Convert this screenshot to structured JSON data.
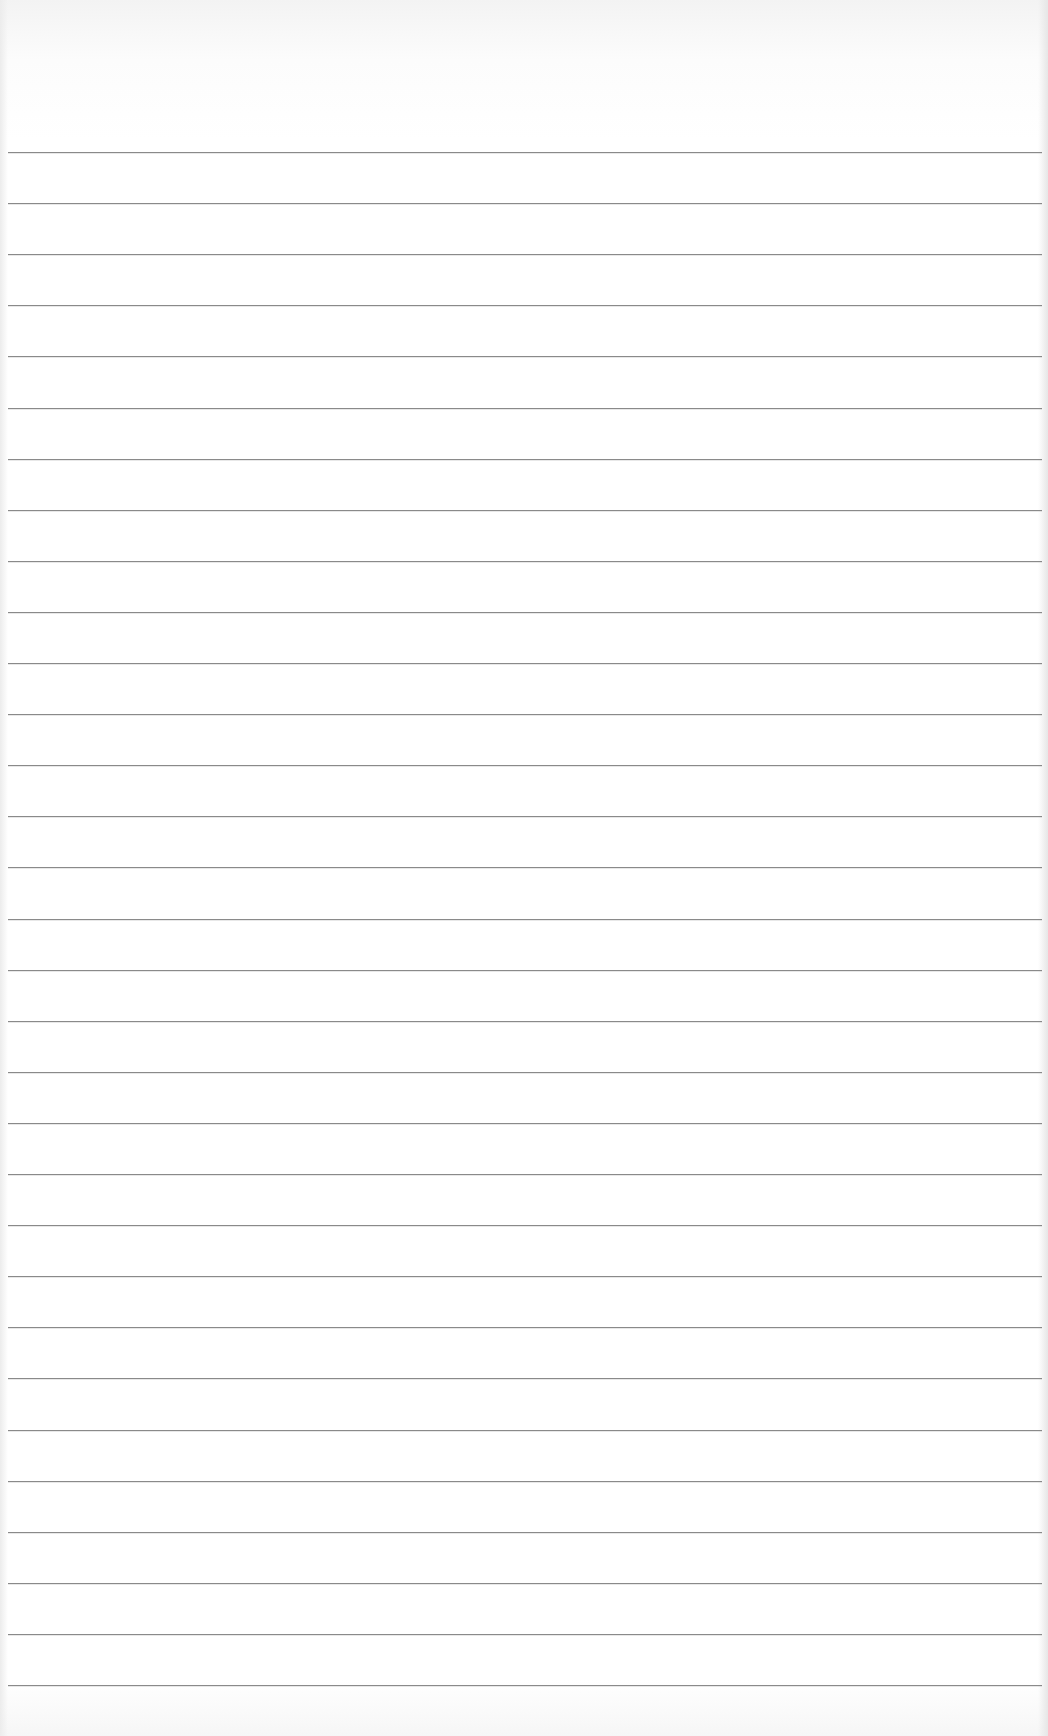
{
  "document": {
    "type": "lined-paper",
    "text_content": "",
    "rule_count": 31,
    "first_rule_y": 152,
    "rule_spacing_px": 51.1,
    "rule_left_x": 8,
    "rule_width_px": 1034,
    "colors": {
      "paper": "#ffffff",
      "rule": "#8a8a8a",
      "edge_shadow": "#e6e6e6"
    }
  }
}
